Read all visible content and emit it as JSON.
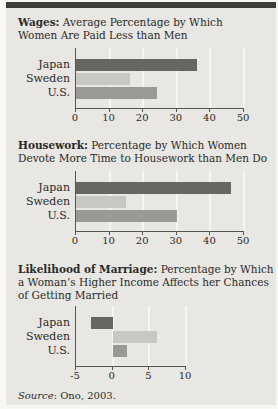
{
  "figure": {
    "page_bg": "#f8f7f4",
    "card_bg": "#e8e7e3",
    "top_rule_color": "#403e3b",
    "text_color": "#2b2a28",
    "axis_color": "#56544f",
    "gridline_color": "#f6f5f2"
  },
  "sections": [
    {
      "lead": "Wages:",
      "line1_rest": " Average Percentage by Which",
      "line2": "Women Are Paid Less than Men"
    },
    {
      "lead": "Housework:",
      "line1_rest": " Percentage by Which Women",
      "line2": "Devote More Time to Housework than Men Do"
    },
    {
      "lead": "Likelihood of Marriage:",
      "line1_rest": " Percentage by Which",
      "line2": "a Woman’s Higher Income Affects her Chances",
      "line3": "of Getting Married"
    }
  ],
  "source": {
    "label": "Source",
    "text": ": Ono, 2003."
  },
  "chart_data": [
    {
      "type": "bar",
      "orientation": "horizontal",
      "title": "Wages: Average Percentage by Which Women Are Paid Less than Men",
      "categories": [
        "Japan",
        "Sweden",
        "U.S."
      ],
      "values": [
        36,
        16,
        24
      ],
      "xlim": [
        0,
        50
      ],
      "xticks": [
        0,
        10,
        20,
        30,
        40,
        50
      ],
      "grid": true,
      "bar_colors": [
        "#676663",
        "#c9c7c2",
        "#9b9993"
      ],
      "plot_width_px": 168
    },
    {
      "type": "bar",
      "orientation": "horizontal",
      "title": "Housework: Percentage by Which Women Devote More Time to Housework than Men Do",
      "categories": [
        "Japan",
        "Sweden",
        "U.S."
      ],
      "values": [
        46,
        15,
        30
      ],
      "xlim": [
        0,
        50
      ],
      "xticks": [
        0,
        10,
        20,
        30,
        40,
        50
      ],
      "grid": true,
      "bar_colors": [
        "#676663",
        "#c9c7c2",
        "#9b9993"
      ],
      "plot_width_px": 168
    },
    {
      "type": "bar",
      "orientation": "horizontal",
      "title": "Likelihood of Marriage: Percentage by Which a Woman’s Higher Income Affects her Chances of Getting Married",
      "categories": [
        "Japan",
        "Sweden",
        "U.S."
      ],
      "values": [
        -3,
        6,
        2
      ],
      "xlim": [
        -5,
        10
      ],
      "xticks": [
        -5,
        0,
        5,
        10
      ],
      "grid": true,
      "bar_colors": [
        "#676663",
        "#c9c7c2",
        "#9b9993"
      ],
      "plot_width_px": 110
    }
  ]
}
